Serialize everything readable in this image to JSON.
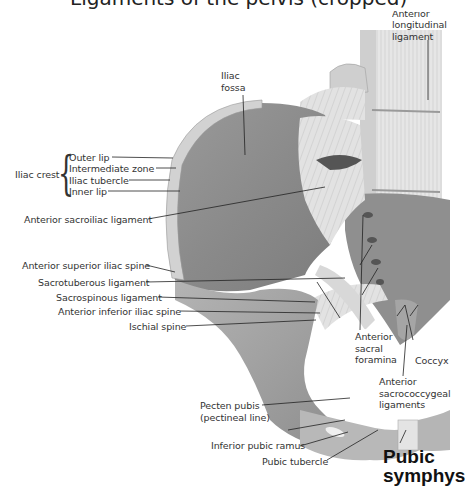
{
  "figure": {
    "title_cropped": "Ligaments of the pelvis (cropped)",
    "colors": {
      "background": "#ffffff",
      "bone_dark": "#8a8a8a",
      "bone_light": "#d6d6d6",
      "ligament": "#e4e4e4",
      "leader_line": "#222222",
      "text": "#333333"
    }
  },
  "labels": {
    "anterior_longitudinal_ligament": {
      "line1": "Anterior",
      "line2": "longitudinal",
      "line3": "ligament"
    },
    "iliac_fossa": {
      "line1": "Iliac",
      "line2": "fossa"
    },
    "iliac_crest": {
      "group": "Iliac crest",
      "parts": [
        "Outer lip",
        "Intermediate zone",
        "Iliac tubercle",
        "Inner lip"
      ]
    },
    "anterior_sacroiliac_ligament": "Anterior sacroiliac ligament",
    "anterior_superior_iliac_spine": "Anterior superior iliac spine",
    "sacrotuberous_ligament": "Sacrotuberous ligament",
    "sacrospinous_ligament": "Sacrospinous ligament",
    "anterior_inferior_iliac_spine": "Anterior inferior iliac spine",
    "ischial_spine": "Ischial spine",
    "anterior_sacral_foramina": {
      "line1": "Anterior",
      "line2": "sacral",
      "line3": "foramina"
    },
    "coccyx": "Coccyx",
    "anterior_sacrococcygeal_ligaments": {
      "line1": "Anterior",
      "line2": "sacrococcygeal",
      "line3": "ligaments"
    },
    "pecten_pubis": {
      "line1": "Pecten pubis",
      "line2": "(pectineal line)"
    },
    "inferior_pubic_ramus": "Inferior pubic ramus",
    "pubic_tubercle": "Pubic tubercle",
    "pubic_symphysis": {
      "line1": "Pubic",
      "line2": "symphys"
    }
  }
}
